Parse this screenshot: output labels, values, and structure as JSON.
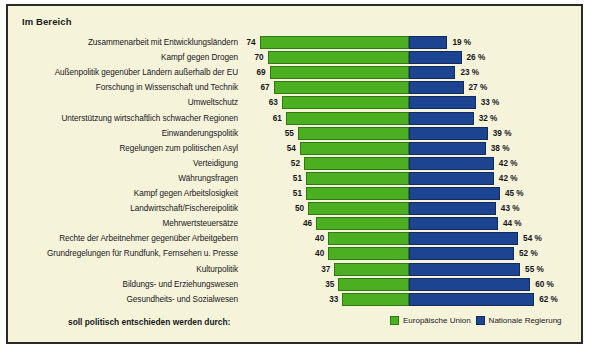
{
  "title": "Im Bereich",
  "footer_note": "soll politisch entschieden werden durch:",
  "legend": {
    "eu": "Europäische Union",
    "national": "Nationale Regierung"
  },
  "colors": {
    "eu": "#4cae21",
    "national": "#1c4491",
    "background": "#f6f3db",
    "border": "#2a2a2a"
  },
  "percent_suffix": "%",
  "chart_data": {
    "type": "bar",
    "title": "Im Bereich",
    "subtitle": "soll politisch entschieden werden durch:",
    "xlabel": "",
    "ylabel": "",
    "grid": false,
    "legend_position": "bottom-right",
    "orientation": "horizontal",
    "stacked": true,
    "xlim": [
      0,
      100
    ],
    "categories": [
      "Zusammenarbeit mit Entwicklungsländern",
      "Kampf gegen Drogen",
      "Außenpolitik gegenüber Ländern außerhalb der EU",
      "Forschung in Wissenschaft und Technik",
      "Umweltschutz",
      "Unterstützung wirtschaftlich schwacher Regionen",
      "Einwanderungspolitik",
      "Regelungen zum politischen Asyl",
      "Verteidigung",
      "Währungsfragen",
      "Kampf gegen Arbeitslosigkeit",
      "Landwirtschaft/Fischereipolitik",
      "Mehrwertsteuersätze",
      "Rechte der Arbeitnehmer gegenüber Arbeitgebern",
      "Grundregelungen für Rundfunk, Fernsehen u. Presse",
      "Kulturpolitik",
      "Bildungs- und Erziehungswesen",
      "Gesundheits- und Sozialwesen"
    ],
    "series": [
      {
        "name": "Europäische Union",
        "color": "#4cae21",
        "values": [
          74,
          70,
          69,
          67,
          63,
          61,
          55,
          54,
          52,
          51,
          51,
          50,
          46,
          40,
          40,
          37,
          35,
          33
        ]
      },
      {
        "name": "Nationale Regierung",
        "color": "#1c4491",
        "values": [
          19,
          26,
          23,
          27,
          33,
          32,
          39,
          38,
          42,
          42,
          45,
          43,
          44,
          54,
          52,
          55,
          60,
          62
        ]
      }
    ]
  },
  "rows": [
    {
      "label": "Zusammenarbeit mit Entwicklungsländern",
      "eu": "74",
      "national": "19 %"
    },
    {
      "label": "Kampf gegen Drogen",
      "eu": "70",
      "national": "26 %"
    },
    {
      "label": "Außenpolitik gegenüber Ländern außerhalb der EU",
      "eu": "69",
      "national": "23 %"
    },
    {
      "label": "Forschung in Wissenschaft und Technik",
      "eu": "67",
      "national": "27 %"
    },
    {
      "label": "Umweltschutz",
      "eu": "63",
      "national": "33 %"
    },
    {
      "label": "Unterstützung wirtschaftlich schwacher Regionen",
      "eu": "61",
      "national": "32 %"
    },
    {
      "label": "Einwanderungspolitik",
      "eu": "55",
      "national": "39 %"
    },
    {
      "label": "Regelungen zum politischen Asyl",
      "eu": "54",
      "national": "38 %"
    },
    {
      "label": "Verteidigung",
      "eu": "52",
      "national": "42 %"
    },
    {
      "label": "Währungsfragen",
      "eu": "51",
      "national": "42 %"
    },
    {
      "label": "Kampf gegen Arbeitslosigkeit",
      "eu": "51",
      "national": "45 %"
    },
    {
      "label": "Landwirtschaft/Fischereipolitik",
      "eu": "50",
      "national": "43 %"
    },
    {
      "label": "Mehrwertsteuersätze",
      "eu": "46",
      "national": "44 %"
    },
    {
      "label": "Rechte der Arbeitnehmer gegenüber Arbeitgebern",
      "eu": "40",
      "national": "54 %"
    },
    {
      "label": "Grundregelungen für Rundfunk, Fernsehen u. Presse",
      "eu": "40",
      "national": "52 %"
    },
    {
      "label": "Kulturpolitik",
      "eu": "37",
      "national": "55 %"
    },
    {
      "label": "Bildungs- und Erziehungswesen",
      "eu": "35",
      "national": "60 %"
    },
    {
      "label": "Gesundheits- und Sozialwesen",
      "eu": "33",
      "national": "62 %"
    }
  ]
}
